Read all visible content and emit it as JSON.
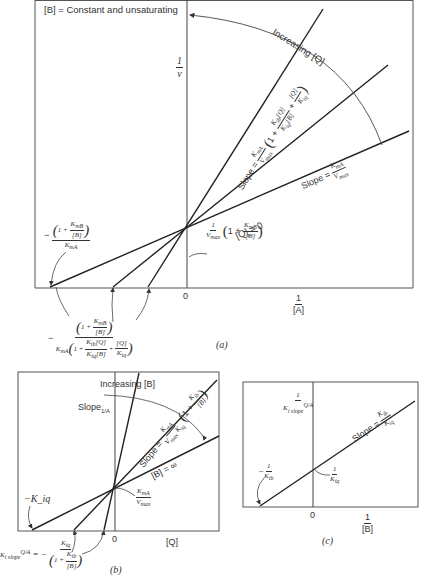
{
  "panel_a": {
    "label": "(a)",
    "condition": "[B] = Constant and unsaturating",
    "y_axis_label_num": "1",
    "y_axis_label_den": "v",
    "x_axis_label_num": "1",
    "x_axis_label_den": "[A]",
    "origin_label": "0",
    "increasing_label": "Increasing [Q]",
    "q_zero_label": "[Q] = 0",
    "slope_min_prefix": "Slope =",
    "slope_min_num": "K_mA",
    "slope_min_den": "V_max",
    "slope_inhib_prefix": "Slope =",
    "slope_inhib_num": "K_mA",
    "slope_inhib_den": "V_max",
    "slope_inhib_factor": "(1 + K_ib[Q]/K_iq[B] + [Q]/K_iq)",
    "y_intercept_label": "1/V_max (1 + K_mB/[B])",
    "x_intercept_q0_label": "−(1 + K_mB/[B]) / K_mA",
    "x_intercept_q_label": "−(1 + K_mB/[B]) / K_mA(1 + K_ib[Q]/K_iq[B] + [Q]/K_iq)"
  },
  "panel_b": {
    "label": "(b)",
    "x_axis_label": "[Q]",
    "origin_label": "0",
    "y_axis_label": "Slope_1/A",
    "increasing_label": "Increasing [B]",
    "b_inf_label": "[B] = ∞",
    "slope_label": "Slope = K_mA/(V_max K_iq) (1 + K_ib/[B])",
    "y_intercept_label": "K_mA/V_max",
    "x_intercept_inf_label": "−K_iq",
    "x_intercept_label": "K_i,slope^Q/A = −K_iq/(1 + K_ib/[B])"
  },
  "panel_c": {
    "label": "(c)",
    "y_axis_label": "1/K_i,slope^Q/A",
    "x_axis_label_num": "1",
    "x_axis_label_den": "[B]",
    "origin_label": "0",
    "slope_label": "Slope = K_ib/K_iq",
    "y_intercept_label": "1/K_iq",
    "x_intercept_label": "−1/K_ib"
  },
  "colors": {
    "line": "#2a2a2a",
    "frame": "#555555",
    "background": "#ffffff"
  }
}
